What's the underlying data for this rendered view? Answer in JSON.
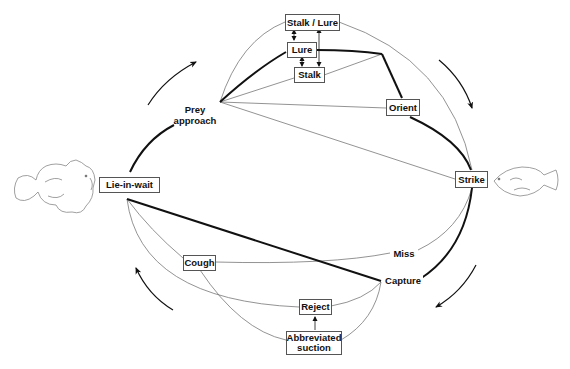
{
  "diagram": {
    "type": "behavioral-sequence-cycle",
    "nodes": {
      "lie_in_wait": "Lie-in-wait",
      "prey_approach_line1": "Prey",
      "prey_approach_line2": "approach",
      "stalk_lure": "Stalk / Lure",
      "lure": "Lure",
      "stalk": "Stalk",
      "orient": "Orient",
      "strike": "Strike",
      "miss": "Miss",
      "capture": "Capture",
      "cough": "Cough",
      "reject": "Reject",
      "abbreviated_suction_line1": "Abbreviated",
      "abbreviated_suction_line2": "suction"
    },
    "illustrations": {
      "predator": "frogfish-outline",
      "prey": "fish-outline"
    },
    "cycle_direction": "clockwise",
    "colors": {
      "line": "#111111",
      "thin_line": "#777777",
      "box_border": "#555555",
      "background": "#ffffff"
    }
  }
}
